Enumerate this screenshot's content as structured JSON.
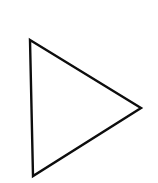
{
  "canvas": {
    "width": 158,
    "height": 183,
    "background_color": "#ffffff",
    "title": "Right-pointing triangle outline"
  },
  "shape": {
    "name": "triangle",
    "icon_name": "play-triangle-icon",
    "orientation": "right-pointing",
    "stroke_color": "#0d0d0d",
    "fill_color": "none",
    "stroke_width": 2.4,
    "stroke_linejoin": "miter",
    "points": "30,40 141,108 33,176",
    "vertices": [
      {
        "label": "top-left",
        "x": 30,
        "y": 40
      },
      {
        "label": "right",
        "x": 141,
        "y": 108
      },
      {
        "label": "bottom-left",
        "x": 33,
        "y": 176
      }
    ],
    "edges": [
      {
        "name": "upper-right-edge",
        "from": "top-left",
        "to": "right"
      },
      {
        "name": "lower-right-edge",
        "from": "right",
        "to": "bottom-left"
      },
      {
        "name": "left-edge",
        "from": "bottom-left",
        "to": "top-left"
      }
    ]
  }
}
